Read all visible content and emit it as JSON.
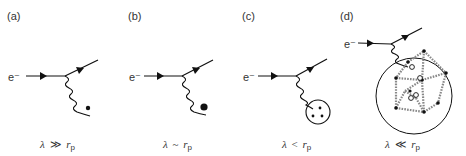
{
  "panels": [
    {
      "id": "a",
      "label": "(a)",
      "electron": "e⁻",
      "probe": "point-dot",
      "caption": {
        "lambda": "λ",
        "relation": "≫",
        "r": "r",
        "sub": "p"
      }
    },
    {
      "id": "b",
      "label": "(b)",
      "electron": "e⁻",
      "probe": "large-dot",
      "caption": {
        "lambda": "λ",
        "relation": "~",
        "r": "r",
        "sub": "p"
      }
    },
    {
      "id": "c",
      "label": "(c)",
      "electron": "e⁻",
      "probe": "circle-with-three-quarks",
      "caption": {
        "lambda": "λ",
        "relation": "<",
        "r": "r",
        "sub": "p"
      }
    },
    {
      "id": "d",
      "label": "(d)",
      "electron": "e⁻",
      "probe": "proton-with-quarks-and-gluon-network",
      "caption": {
        "lambda": "λ",
        "relation": "≪",
        "r": "r",
        "sub": "p"
      }
    }
  ],
  "colors": {
    "line": "#111111",
    "text": "#333333",
    "gluon": "#999999"
  }
}
